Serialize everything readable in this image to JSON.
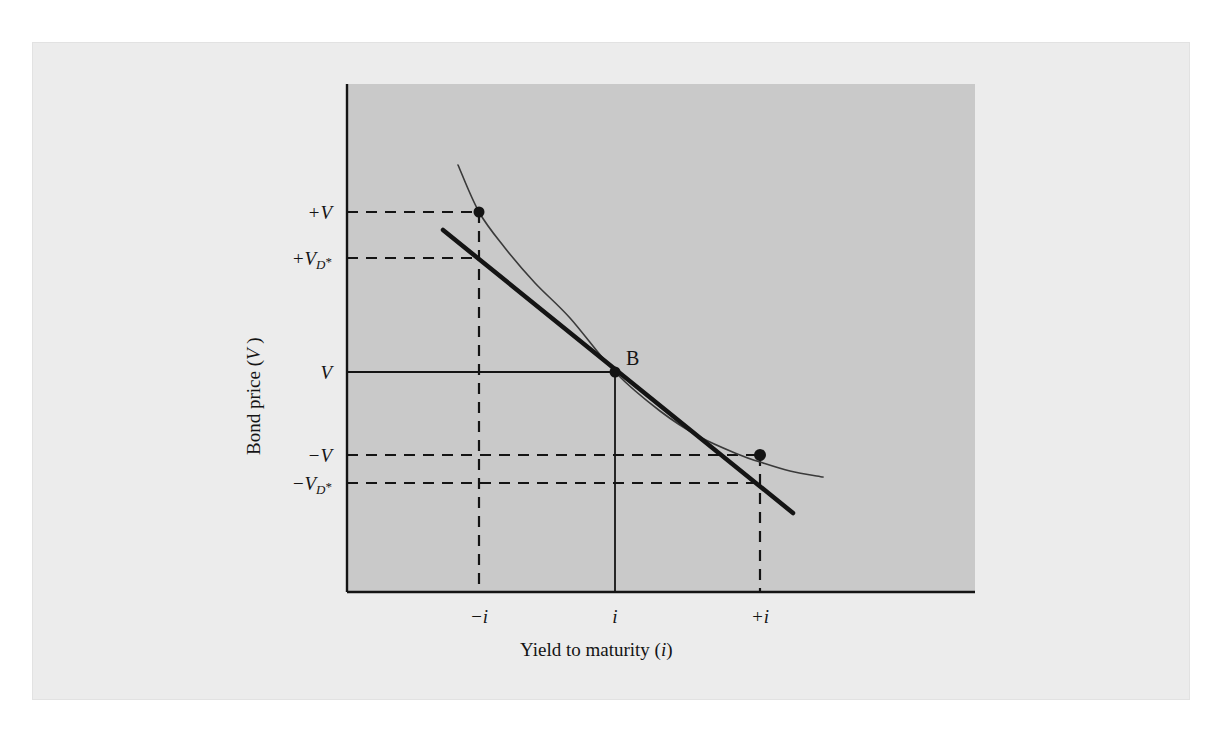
{
  "figure": {
    "background_color": "#ffffff",
    "panel_color": "#ececec",
    "plot_area_color": "#c9c9c9",
    "ink_color": "#141414"
  },
  "axes": {
    "x_title_prefix": "Yield to maturity (",
    "x_title_variable": "i",
    "x_title_suffix": ")",
    "y_title_prefix": "Bond price (",
    "y_title_variable": "V",
    "y_title_suffix": " )",
    "x_ticks": [
      {
        "label": "−i",
        "x_px": 479
      },
      {
        "label": "i",
        "x_px": 615
      },
      {
        "label": "+i",
        "x_px": 760
      }
    ],
    "y_ticks": [
      {
        "label": "+V",
        "base": "+V",
        "sub": "",
        "star": "",
        "y_px": 212
      },
      {
        "label": "+V_D*",
        "base": "+V",
        "sub": "D",
        "star": "*",
        "y_px": 258
      },
      {
        "label": "V",
        "base": "V",
        "sub": "",
        "star": "",
        "y_px": 372
      },
      {
        "label": "−V",
        "base": "−V",
        "sub": "",
        "star": "",
        "y_px": 455
      },
      {
        "label": "−V_D*",
        "base": "−V",
        "sub": "D",
        "star": "*",
        "y_px": 483
      }
    ]
  },
  "annotations": {
    "tangency_point_label": "B"
  },
  "chart_data": {
    "type": "line",
    "title": "",
    "subtitle": "",
    "xlabel": "Yield to maturity (i)",
    "ylabel": "Bond price (V )",
    "grid": false,
    "legend_position": "none",
    "xlim": [
      347,
      975
    ],
    "ylim": [
      84,
      592
    ],
    "x_tick_labels": [
      "−i",
      "i",
      "+i"
    ],
    "x_tick_positions": [
      479,
      615,
      760
    ],
    "y_tick_labels": [
      "+V",
      "+V_D*",
      "V",
      "−V",
      "−V_D*"
    ],
    "y_tick_positions": [
      212,
      258,
      372,
      455,
      483
    ],
    "series": [
      {
        "name": "price-yield curve",
        "style": "thin-convex-curve",
        "stroke_width": 1.6,
        "points": [
          [
            458,
            165
          ],
          [
            479,
            212
          ],
          [
            505,
            248
          ],
          [
            535,
            283
          ],
          [
            570,
            318
          ],
          [
            615,
            372
          ],
          [
            660,
            411
          ],
          [
            700,
            437
          ],
          [
            740,
            455
          ],
          [
            760,
            462
          ],
          [
            790,
            471
          ],
          [
            823,
            477
          ]
        ]
      },
      {
        "name": "duration tangent line",
        "style": "thick-straight-line",
        "stroke_width": 4.5,
        "points": [
          [
            443,
            230
          ],
          [
            615,
            372
          ],
          [
            793,
            513
          ]
        ]
      }
    ],
    "markers": [
      {
        "name": "curve-point-at-minus-i",
        "x": 479,
        "y": 212,
        "radius": 5.5
      },
      {
        "name": "tangency-point-B",
        "x": 615,
        "y": 372,
        "radius": 5.5
      },
      {
        "name": "curve-point-at-plus-i",
        "x": 760,
        "y": 455,
        "radius": 6.0
      }
    ],
    "reference_lines": [
      {
        "name": "solid-line-V-to-B",
        "style": "solid",
        "from": [
          347,
          372
        ],
        "to": [
          615,
          372
        ]
      },
      {
        "name": "solid-line-B-to-i-axis",
        "style": "solid",
        "from": [
          615,
          372
        ],
        "to": [
          615,
          592
        ]
      },
      {
        "name": "dashed-line-plusV",
        "style": "dashed",
        "from": [
          347,
          212
        ],
        "to": [
          479,
          212
        ]
      },
      {
        "name": "dashed-line-plusVD",
        "style": "dashed",
        "from": [
          347,
          258
        ],
        "to": [
          479,
          258
        ]
      },
      {
        "name": "dashed-line-minus-i-vertical",
        "style": "dashed",
        "from": [
          479,
          212
        ],
        "to": [
          479,
          592
        ]
      },
      {
        "name": "dashed-line-minusV",
        "style": "dashed",
        "from": [
          347,
          455
        ],
        "to": [
          760,
          455
        ]
      },
      {
        "name": "dashed-line-minusVD",
        "style": "dashed",
        "from": [
          347,
          483
        ],
        "to": [
          760,
          483
        ]
      },
      {
        "name": "dashed-line-plus-i-vertical",
        "style": "dashed",
        "from": [
          760,
          455
        ],
        "to": [
          760,
          592
        ]
      }
    ]
  }
}
